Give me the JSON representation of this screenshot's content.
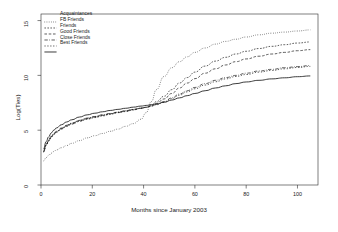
{
  "chart_data": {
    "type": "line",
    "title": "",
    "xlabel": "Months since January 2003",
    "ylabel": "Log(Ties)",
    "xlim": [
      0,
      108
    ],
    "ylim": [
      0,
      15.6
    ],
    "xticks": [
      "0",
      "20",
      "40",
      "60",
      "80",
      "100"
    ],
    "xtick_values": [
      0,
      20,
      40,
      60,
      80,
      100
    ],
    "yticks": [
      "0",
      "5",
      "10",
      "15"
    ],
    "ytick_values": [
      0,
      5,
      10,
      15
    ],
    "grid": false,
    "legend_position": "top-left",
    "x": [
      1,
      2,
      3,
      4,
      5,
      6,
      8,
      10,
      12,
      15,
      18,
      21,
      24,
      27,
      30,
      33,
      36,
      39,
      41,
      43,
      45,
      48,
      51,
      54,
      57,
      60,
      64,
      68,
      72,
      76,
      80,
      85,
      90,
      95,
      100,
      105
    ],
    "series": [
      {
        "name": "Acquaintances",
        "style": "dotted",
        "color": "#1a1a1a",
        "values": [
          2.2,
          2.5,
          2.7,
          2.9,
          3.05,
          3.2,
          3.4,
          3.6,
          3.8,
          4.05,
          4.3,
          4.5,
          4.7,
          4.9,
          5.1,
          5.35,
          5.6,
          6.0,
          6.6,
          7.6,
          8.7,
          9.9,
          10.7,
          11.25,
          11.7,
          12.1,
          12.5,
          12.85,
          13.1,
          13.3,
          13.5,
          13.7,
          13.85,
          13.95,
          14.05,
          14.15
        ]
      },
      {
        "name": "FB Friends",
        "style": "fine-dash",
        "color": "#1a1a1a",
        "values": [
          3.0,
          3.6,
          4.0,
          4.35,
          4.6,
          4.8,
          5.1,
          5.35,
          5.55,
          5.8,
          6.0,
          6.15,
          6.3,
          6.45,
          6.6,
          6.7,
          6.85,
          7.0,
          7.1,
          7.3,
          7.6,
          8.1,
          8.7,
          9.3,
          9.8,
          10.3,
          10.85,
          11.3,
          11.65,
          11.95,
          12.2,
          12.45,
          12.65,
          12.8,
          12.95,
          13.05
        ]
      },
      {
        "name": "Friends",
        "style": "dashed",
        "color": "#1a1a1a",
        "values": [
          3.05,
          3.65,
          4.05,
          4.4,
          4.65,
          4.85,
          5.15,
          5.4,
          5.6,
          5.85,
          6.05,
          6.2,
          6.35,
          6.5,
          6.62,
          6.75,
          6.88,
          7.0,
          7.08,
          7.22,
          7.45,
          7.85,
          8.35,
          8.85,
          9.3,
          9.7,
          10.2,
          10.6,
          10.95,
          11.25,
          11.5,
          11.75,
          11.95,
          12.1,
          12.25,
          12.35
        ]
      },
      {
        "name": "Good Friends",
        "style": "dash-dot",
        "color": "#1a1a1a",
        "values": [
          3.1,
          3.7,
          4.1,
          4.45,
          4.7,
          4.9,
          5.2,
          5.45,
          5.65,
          5.9,
          6.1,
          6.25,
          6.4,
          6.52,
          6.65,
          6.78,
          6.9,
          7.02,
          7.1,
          7.2,
          7.35,
          7.6,
          7.95,
          8.3,
          8.6,
          8.9,
          9.25,
          9.55,
          9.8,
          10.0,
          10.2,
          10.4,
          10.55,
          10.7,
          10.8,
          10.9
        ]
      },
      {
        "name": "Close Friends",
        "style": "loose-dash",
        "color": "#1a1a1a",
        "values": [
          3.05,
          3.65,
          4.05,
          4.4,
          4.65,
          4.85,
          5.15,
          5.42,
          5.62,
          5.88,
          6.08,
          6.24,
          6.38,
          6.5,
          6.63,
          6.76,
          6.88,
          7.0,
          7.08,
          7.18,
          7.32,
          7.55,
          7.88,
          8.2,
          8.5,
          8.78,
          9.12,
          9.42,
          9.68,
          9.9,
          10.08,
          10.3,
          10.45,
          10.6,
          10.72,
          10.82
        ]
      },
      {
        "name": "Best Friends",
        "style": "solid",
        "color": "#1a1a1a",
        "values": [
          3.3,
          3.95,
          4.4,
          4.75,
          5.0,
          5.2,
          5.5,
          5.75,
          5.95,
          6.2,
          6.4,
          6.55,
          6.68,
          6.8,
          6.9,
          7.0,
          7.1,
          7.2,
          7.26,
          7.32,
          7.4,
          7.55,
          7.75,
          7.95,
          8.15,
          8.35,
          8.6,
          8.85,
          9.05,
          9.25,
          9.4,
          9.55,
          9.68,
          9.78,
          9.88,
          9.95
        ]
      }
    ]
  }
}
